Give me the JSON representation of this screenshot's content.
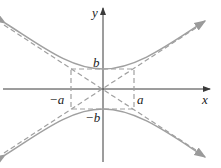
{
  "diagram": {
    "labels": {
      "x_axis": "x",
      "y_axis": "y",
      "b": "b",
      "neg_b": "−b",
      "a": "a",
      "neg_a": "−a"
    },
    "colors": {
      "axes": "#3a3a3a",
      "curve": "#a0a0a0",
      "dashed": "#a0a0a0"
    }
  }
}
